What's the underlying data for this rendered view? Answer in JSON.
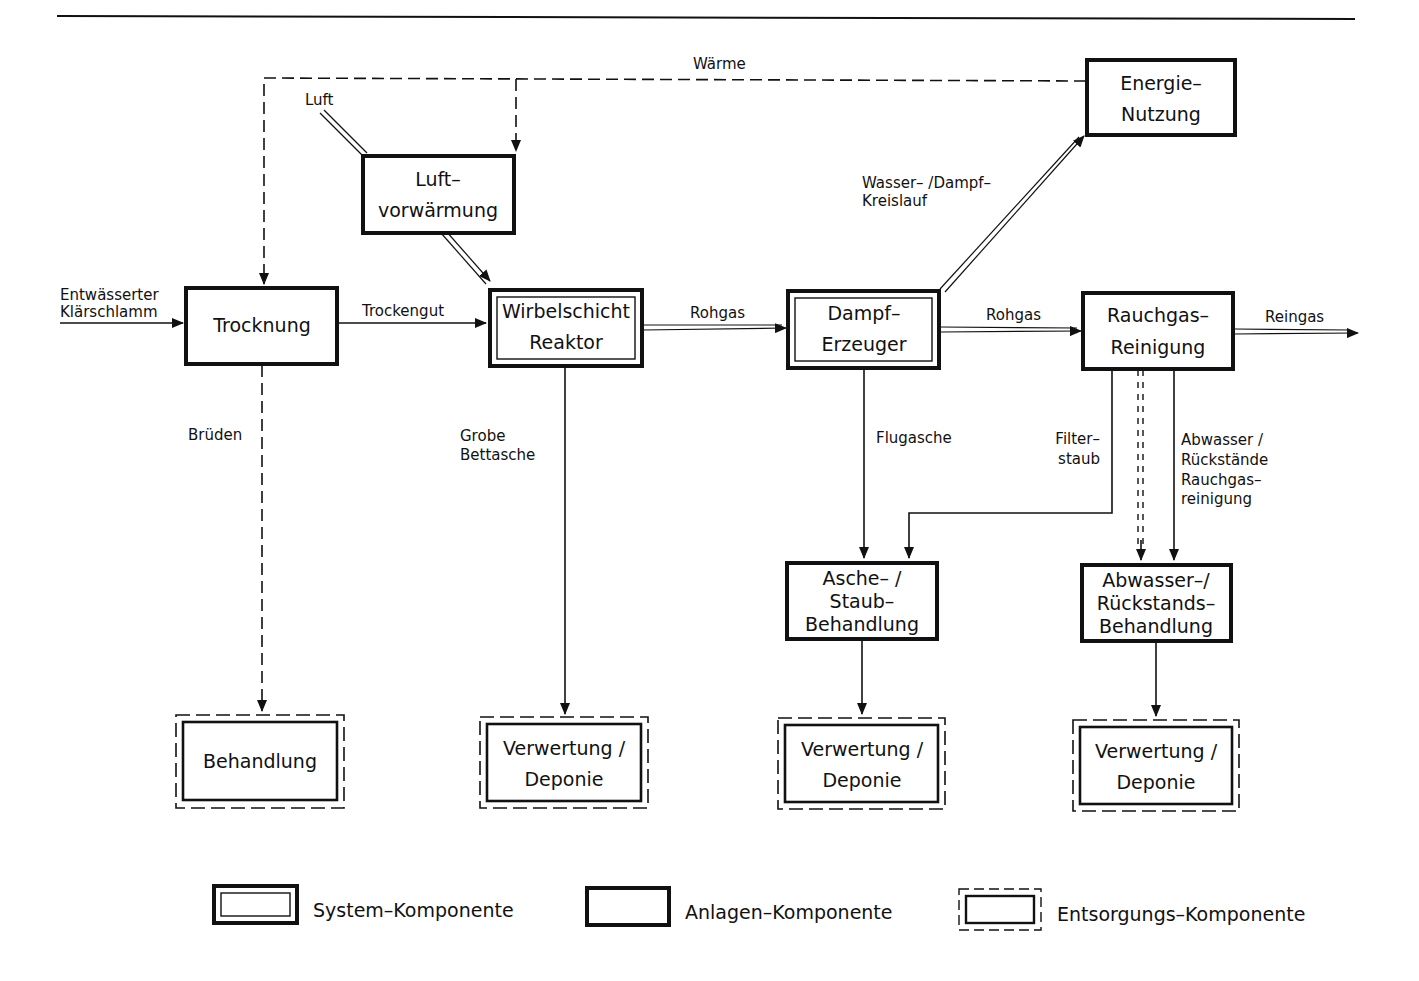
{
  "diagram": {
    "type": "process-flow",
    "colors": {
      "ink": "#111111",
      "background": "#ffffff"
    },
    "components": {
      "trocknung": {
        "lines": [
          "Trocknung"
        ],
        "kind": "anlagen"
      },
      "luftvorwaermung": {
        "lines": [
          "Luft–",
          "vorwärmung"
        ],
        "kind": "anlagen"
      },
      "wirbelschicht": {
        "lines": [
          "Wirbelschicht",
          "Reaktor"
        ],
        "kind": "system"
      },
      "dampferzeuger": {
        "lines": [
          "Dampf–",
          "Erzeuger"
        ],
        "kind": "system"
      },
      "energienutzung": {
        "lines": [
          "Energie–",
          "Nutzung"
        ],
        "kind": "anlagen"
      },
      "rauchgasreinigung": {
        "lines": [
          "Rauchgas–",
          "Reinigung"
        ],
        "kind": "anlagen"
      },
      "ascheStaub": {
        "lines": [
          "Asche– /",
          "Staub–",
          "Behandlung"
        ],
        "kind": "anlagen"
      },
      "abwasserRueck": {
        "lines": [
          "Abwasser–/",
          "Rückstands–",
          "Behandlung"
        ],
        "kind": "anlagen"
      },
      "behandlung": {
        "lines": [
          "Behandlung"
        ],
        "kind": "entsorgung"
      },
      "verwertung1": {
        "lines": [
          "Verwertung /",
          "Deponie"
        ],
        "kind": "entsorgung"
      },
      "verwertung2": {
        "lines": [
          "Verwertung /",
          "Deponie"
        ],
        "kind": "entsorgung"
      },
      "verwertung3": {
        "lines": [
          "Verwertung /",
          "Deponie"
        ],
        "kind": "entsorgung"
      }
    },
    "flows": {
      "waerme": "Wärme",
      "luft": "Luft",
      "input": [
        "Entwässerter",
        "Klärschlamm"
      ],
      "trockengut": "Trockengut",
      "rohgas1": "Rohgas",
      "rohgas2": "Rohgas",
      "reingas": "Reingas",
      "wasserDampf": [
        "Wasser– /Dampf–",
        "Kreislauf"
      ],
      "brueden": "Brüden",
      "grobeBettasche": [
        "Grobe",
        "Bettasche"
      ],
      "flugasche": "Flugasche",
      "filterstaub": [
        "Filter–",
        "staub"
      ],
      "abwasserRueckstaende": [
        "Abwasser /",
        "Rückstände",
        "Rauchgas–",
        "reinigung"
      ]
    },
    "legend": [
      {
        "kind": "system",
        "label": "System–Komponente"
      },
      {
        "kind": "anlagen",
        "label": "Anlagen–Komponente"
      },
      {
        "kind": "entsorgung",
        "label": "Entsorgungs–Komponente"
      }
    ]
  }
}
